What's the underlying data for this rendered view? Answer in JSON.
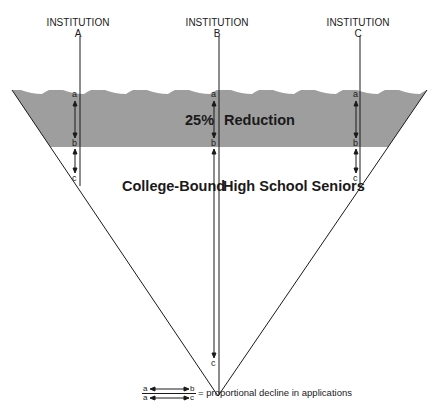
{
  "diagram": {
    "type": "funnel-diagram",
    "institutions": [
      {
        "label": "INSTITUTION",
        "letter": "A",
        "x": 79,
        "point_a": "a",
        "point_b": "b",
        "point_c": "c"
      },
      {
        "label": "INSTITUTION",
        "letter": "B",
        "x": 218,
        "point_a": "a",
        "point_b": "b",
        "point_c": "c"
      },
      {
        "label": "INSTITUTION",
        "letter": "C",
        "x": 360,
        "point_a": "a",
        "point_b": "b",
        "point_c": "c"
      }
    ],
    "band": {
      "percent": "25%",
      "label": "Reduction",
      "fill": "#9e9e9e"
    },
    "population_label_left": "College-Bound",
    "population_label_right": "High School Seniors",
    "legend": {
      "top_from": "a",
      "top_to": "b",
      "bottom_from": "a",
      "bottom_to": "c",
      "text": "= proportional decline in applications"
    }
  }
}
